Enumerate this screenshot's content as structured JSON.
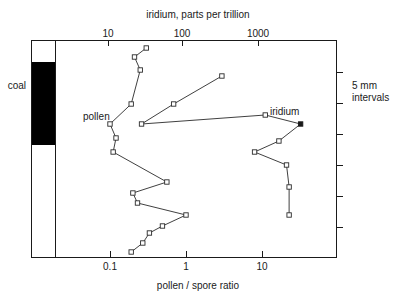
{
  "chart_data": {
    "type": "line",
    "title": "",
    "orientation": "vertical-depth",
    "top_axis": {
      "label": "iridium, parts per trillion",
      "scale": "log",
      "ticks": [
        "10",
        "100",
        "1000"
      ],
      "tick_values": [
        10,
        100,
        1000
      ],
      "range": [
        3.0,
        6000
      ]
    },
    "bottom_axis": {
      "label": "pollen / spore ratio",
      "scale": "log",
      "ticks": [
        "0.1",
        "1",
        "10"
      ],
      "tick_values": [
        0.1,
        1,
        10
      ],
      "range": [
        0.03,
        60
      ]
    },
    "right_axis": {
      "label_line1": "5 mm",
      "label_line2": "intervals",
      "tick_count": 6,
      "grid": false
    },
    "lithology": {
      "label": "coal",
      "unit_name": "coal-bed",
      "fill_color": "#000000"
    },
    "legend_position": "inline-annotations",
    "series": [
      {
        "name": "pollen",
        "annotation": "pollen",
        "axis": "bottom",
        "marker": "open-square",
        "points": [
          {
            "x": 0.3,
            "depth": 48
          },
          {
            "x": 0.21,
            "depth": 57
          },
          {
            "x": 0.25,
            "depth": 70
          },
          {
            "x": 0.19,
            "depth": 104
          },
          {
            "x": 0.1,
            "depth": 124
          },
          {
            "x": 0.12,
            "depth": 138
          },
          {
            "x": 0.11,
            "depth": 152
          },
          {
            "x": 0.56,
            "depth": 182
          },
          {
            "x": 0.2,
            "depth": 193
          },
          {
            "x": 0.23,
            "depth": 203
          },
          {
            "x": 1.0,
            "depth": 215
          },
          {
            "x": 0.49,
            "depth": 226
          },
          {
            "x": 0.33,
            "depth": 233
          },
          {
            "x": 0.27,
            "depth": 243
          },
          {
            "x": 0.19,
            "depth": 252
          }
        ]
      },
      {
        "name": "iridium",
        "annotation": "iridium",
        "axis": "top",
        "marker": "open-square",
        "points": [
          {
            "x": 330,
            "depth": 76
          },
          {
            "x": 75,
            "depth": 104
          },
          {
            "x": 28,
            "depth": 124
          },
          {
            "x": 1250,
            "depth": 115
          },
          {
            "x": 3700,
            "depth": 124
          },
          {
            "x": 1900,
            "depth": 141
          },
          {
            "x": 900,
            "depth": 152
          },
          {
            "x": 2400,
            "depth": 165
          },
          {
            "x": 2600,
            "depth": 187
          },
          {
            "x": 2600,
            "depth": 215
          }
        ]
      }
    ]
  },
  "annotations": {
    "pollen_label": "pollen",
    "iridium_label": "iridium",
    "coal_label": "coal",
    "interval_line1": "5 mm",
    "interval_line2": "intervals"
  },
  "axis_titles": {
    "top": "iridium, parts per trillion",
    "bottom": "pollen / spore ratio"
  },
  "tick_labels": {
    "top": [
      "10",
      "100",
      "1000"
    ],
    "bottom": [
      "0.1",
      "1",
      "10"
    ]
  }
}
